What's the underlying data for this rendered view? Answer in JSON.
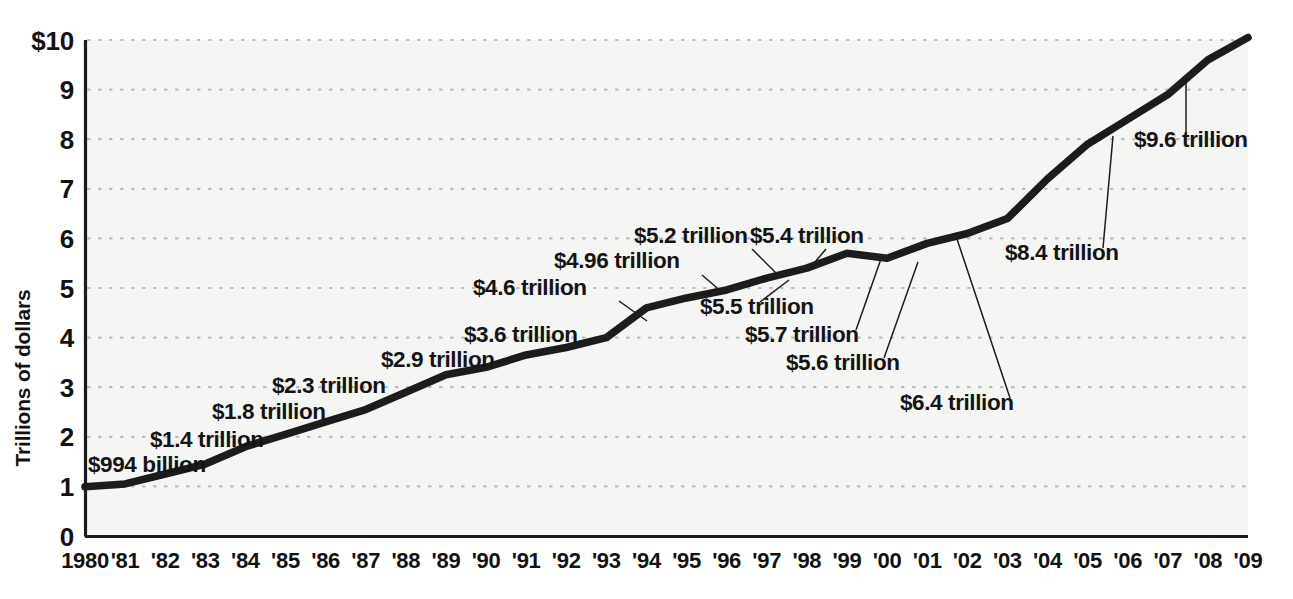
{
  "chart_data": {
    "type": "line",
    "title": "",
    "xlabel": "",
    "ylabel": "Trillions of dollars",
    "ylim": [
      0,
      10
    ],
    "xlim": [
      1980,
      2009
    ],
    "grid": true,
    "legend": null,
    "y_ticks": [
      "$10",
      "9",
      "8",
      "7",
      "6",
      "5",
      "4",
      "3",
      "2",
      "1",
      "0"
    ],
    "y_tick_values": [
      10,
      9,
      8,
      7,
      6,
      5,
      4,
      3,
      2,
      1,
      0
    ],
    "x_tick_labels": [
      "1980",
      "'81",
      "'82",
      "'83",
      "'84",
      "'85",
      "'86",
      "'87",
      "'88",
      "'89",
      "'90",
      "'91",
      "'92",
      "'93",
      "'94",
      "'95",
      "'96",
      "'97",
      "'98",
      "'99",
      "'00",
      "'01",
      "'02",
      "'03",
      "'04",
      "'05",
      "'06",
      "'07",
      "'08",
      "'09"
    ],
    "x": [
      1980,
      1981,
      1982,
      1983,
      1984,
      1985,
      1986,
      1987,
      1988,
      1989,
      1990,
      1991,
      1992,
      1993,
      1994,
      1995,
      1996,
      1997,
      1998,
      1999,
      2000,
      2001,
      2002,
      2003,
      2004,
      2005,
      2006,
      2007,
      2008,
      2009
    ],
    "values": [
      0.994,
      1.05,
      1.25,
      1.45,
      1.8,
      2.05,
      2.3,
      2.55,
      2.9,
      3.25,
      3.4,
      3.65,
      3.8,
      4.0,
      4.6,
      4.8,
      4.96,
      5.2,
      5.4,
      5.7,
      5.6,
      5.9,
      6.1,
      6.4,
      7.2,
      7.9,
      8.4,
      8.9,
      9.6,
      10.05
    ],
    "annotations": [
      {
        "text": "$994 billion",
        "value": 0.994,
        "year": 1980
      },
      {
        "text": "$1.4 trillion",
        "value": 1.4,
        "year": 1983
      },
      {
        "text": "$1.8 trillion",
        "value": 1.8,
        "year": 1984
      },
      {
        "text": "$2.3 trillion",
        "value": 2.3,
        "year": 1986
      },
      {
        "text": "$2.9 trillion",
        "value": 2.9,
        "year": 1988
      },
      {
        "text": "$3.6 trillion",
        "value": 3.6,
        "year": 1991
      },
      {
        "text": "$4.6 trillion",
        "value": 4.6,
        "year": 1994
      },
      {
        "text": "$4.96 trillion",
        "value": 4.96,
        "year": 1996
      },
      {
        "text": "$5.2 trillion",
        "value": 5.2,
        "year": 1997
      },
      {
        "text": "$5.4 trillion",
        "value": 5.4,
        "year": 1998
      },
      {
        "text": "$5.5 trillion",
        "value": 5.5,
        "year": 1997
      },
      {
        "text": "$5.7 trillion",
        "value": 5.7,
        "year": 1999
      },
      {
        "text": "$5.6 trillion",
        "value": 5.6,
        "year": 2000
      },
      {
        "text": "$6.4 trillion",
        "value": 6.4,
        "year": 2003
      },
      {
        "text": "$8.4 trillion",
        "value": 8.4,
        "year": 2006
      },
      {
        "text": "$9.6 trillion",
        "value": 9.6,
        "year": 2008
      }
    ]
  },
  "axis": {
    "y_title": "Trillions of dollars",
    "y_ticks": [
      {
        "label": "$10"
      },
      {
        "label": "9"
      },
      {
        "label": "8"
      },
      {
        "label": "7"
      },
      {
        "label": "6"
      },
      {
        "label": "5"
      },
      {
        "label": "4"
      },
      {
        "label": "3"
      },
      {
        "label": "2"
      },
      {
        "label": "1"
      },
      {
        "label": "0"
      }
    ],
    "x_ticks": [
      {
        "label": "1980"
      },
      {
        "label": "'81"
      },
      {
        "label": "'82"
      },
      {
        "label": "'83"
      },
      {
        "label": "'84"
      },
      {
        "label": "'85"
      },
      {
        "label": "'86"
      },
      {
        "label": "'87"
      },
      {
        "label": "'88"
      },
      {
        "label": "'89"
      },
      {
        "label": "'90"
      },
      {
        "label": "'91"
      },
      {
        "label": "'92"
      },
      {
        "label": "'93"
      },
      {
        "label": "'94"
      },
      {
        "label": "'95"
      },
      {
        "label": "'96"
      },
      {
        "label": "'97"
      },
      {
        "label": "'98"
      },
      {
        "label": "'99"
      },
      {
        "label": "'00"
      },
      {
        "label": "'01"
      },
      {
        "label": "'02"
      },
      {
        "label": "'03"
      },
      {
        "label": "'04"
      },
      {
        "label": "'05"
      },
      {
        "label": "'06"
      },
      {
        "label": "'07"
      },
      {
        "label": "'08"
      },
      {
        "label": "'09"
      }
    ]
  },
  "annotation_labels": [
    {
      "text": "$994 billion"
    },
    {
      "text": "$1.4 trillion"
    },
    {
      "text": "$1.8 trillion"
    },
    {
      "text": "$2.3 trillion"
    },
    {
      "text": "$2.9 trillion"
    },
    {
      "text": "$3.6 trillion"
    },
    {
      "text": "$4.6 trillion"
    },
    {
      "text": "$4.96 trillion"
    },
    {
      "text": "$5.2 trillion"
    },
    {
      "text": "$5.4 trillion"
    },
    {
      "text": "$5.5 trillion"
    },
    {
      "text": "$5.7 trillion"
    },
    {
      "text": "$5.6 trillion"
    },
    {
      "text": "$6.4 trillion"
    },
    {
      "text": "$8.4 trillion"
    },
    {
      "text": "$9.6 trillion"
    }
  ],
  "colors": {
    "line": "#1c1c1c",
    "grid": "#b9bcc0",
    "axis": "#1a1a1a",
    "plot_background": "#f5f5f4",
    "page_background": "#ffffff",
    "text": "#121212"
  }
}
